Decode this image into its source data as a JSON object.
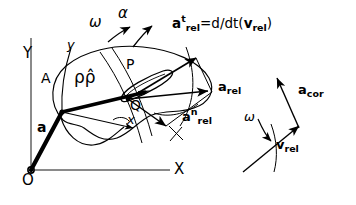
{
  "figure": {
    "background_color": "#ffffff",
    "ink_color": "#000000",
    "axis_color": "#7a7a7a"
  },
  "global_axes": {
    "origin_label": "O",
    "y_label": "Y",
    "x_label": "X"
  },
  "body_axes": {
    "x_label": "x",
    "y_label": "y"
  },
  "points": {
    "A": "A",
    "P": "P",
    "Q": "Q"
  },
  "rotation": {
    "omega": "ω",
    "alpha": "α"
  },
  "position_vector": {
    "rho": "ρ",
    "rho_hat": "ρ̂",
    "combined": "ρρ̂"
  },
  "vectors": {
    "a_base": {
      "symbol": "a",
      "label": "a"
    },
    "a_rel": {
      "symbol": "a",
      "sub": "rel",
      "sup": ""
    },
    "a_rel_t": {
      "symbol": "a",
      "sub": "rel",
      "sup": "t"
    },
    "a_rel_n": {
      "symbol": "a",
      "sub": "rel",
      "sup": "n"
    },
    "a_cor": {
      "symbol": "a",
      "sub": "cor",
      "sup": ""
    },
    "v_rel": {
      "symbol": "v",
      "sub": "rel",
      "sup": ""
    }
  },
  "equation": {
    "lhs_symbol": "a",
    "lhs_sup": "t",
    "lhs_sub": "rel",
    "equals": "=d/dt(",
    "rhs_symbol": "v",
    "rhs_sub": "rel",
    "close": ")"
  },
  "inset": {
    "omega": "ω",
    "v_rel_symbol": "v",
    "v_rel_sub": "rel",
    "a_cor_symbol": "a",
    "a_cor_sub": "cor"
  }
}
